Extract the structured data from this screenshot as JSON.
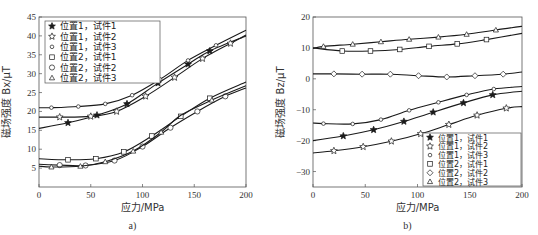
{
  "chart_data": [
    {
      "id": "a",
      "type": "line",
      "title": "",
      "subtitle": "a)",
      "xlabel": "应力/MPa",
      "ylabel": "磁场强度 Bx/μT",
      "xlim": [
        0,
        200
      ],
      "ylim": [
        0,
        45
      ],
      "xticks": [
        0,
        50,
        100,
        150,
        200
      ],
      "yticks": [
        5,
        10,
        15,
        20,
        25,
        30,
        35,
        40,
        45
      ],
      "grid": false,
      "legend_position": "upper left",
      "series": [
        {
          "name": "位置1，试件1",
          "marker": "star-filled",
          "x": [
            0,
            28,
            56,
            85,
            115,
            144,
            165,
            200
          ],
          "y": [
            15.5,
            17,
            19,
            22,
            27.5,
            32.5,
            36,
            40
          ],
          "marker_x": [
            28,
            56,
            85,
            115,
            144,
            165
          ]
        },
        {
          "name": "位置1，试件2",
          "marker": "star-open",
          "x": [
            0,
            20,
            50,
            75,
            103,
            131,
            158,
            185,
            200
          ],
          "y": [
            18.5,
            18.5,
            18.7,
            20,
            24,
            29,
            34,
            38,
            40.2
          ],
          "marker_x": [
            20,
            50,
            75,
            103,
            131,
            158,
            185
          ]
        },
        {
          "name": "位置1，试件3",
          "marker": "circle-small",
          "x": [
            0,
            12,
            38,
            64,
            90,
            117,
            144,
            171,
            200
          ],
          "y": [
            21,
            21,
            21.3,
            22,
            24.3,
            28.5,
            33.5,
            37.5,
            41.5
          ],
          "marker_x": [
            12,
            38,
            64,
            90,
            117,
            144,
            171
          ]
        },
        {
          "name": "位置2，试件1",
          "marker": "square",
          "x": [
            0,
            28,
            55,
            82,
            109,
            137,
            165,
            200
          ],
          "y": [
            7.5,
            7.2,
            7.5,
            9.3,
            13.5,
            18.7,
            23.5,
            27.8
          ],
          "marker_x": [
            28,
            55,
            82,
            109,
            137,
            165
          ]
        },
        {
          "name": "位置2，试件2",
          "marker": "circle",
          "x": [
            0,
            20,
            45,
            73,
            100,
            127,
            153,
            180,
            200
          ],
          "y": [
            6,
            5.8,
            5.7,
            7,
            10.7,
            15.7,
            20,
            24,
            26.2
          ],
          "marker_x": [
            20,
            45,
            73,
            100,
            127,
            153,
            180
          ]
        },
        {
          "name": "位置2，试件3",
          "marker": "triangle",
          "x": [
            0,
            12,
            40,
            64,
            91,
            118,
            137,
            167,
            200
          ],
          "y": [
            5.5,
            5.3,
            5.5,
            6.7,
            9.5,
            14.5,
            19,
            23,
            26.8
          ],
          "marker_x": [
            12,
            40,
            64,
            91,
            118,
            167
          ]
        }
      ]
    },
    {
      "id": "b",
      "type": "line",
      "title": "",
      "subtitle": "b)",
      "xlabel": "应力/MPa",
      "ylabel": "磁场强度 Bz/μT",
      "xlim": [
        0,
        200
      ],
      "ylim": [
        -35,
        20
      ],
      "xticks": [
        0,
        50,
        100,
        150,
        200
      ],
      "yticks": [
        -30,
        -20,
        -10,
        0,
        10,
        20
      ],
      "grid": false,
      "legend_position": "lower right",
      "series": [
        {
          "name": "位置1，试件1",
          "marker": "star-filled",
          "x": [
            0,
            29,
            58,
            87,
            115,
            144,
            172,
            200
          ],
          "y": [
            -20,
            -18.5,
            -16.5,
            -13.8,
            -10.8,
            -7.8,
            -5.2,
            -4
          ],
          "marker_x": [
            29,
            58,
            87,
            115,
            144,
            172
          ]
        },
        {
          "name": "位置1，试件2",
          "marker": "star-open",
          "x": [
            0,
            20,
            48,
            75,
            103,
            130,
            157,
            185,
            200
          ],
          "y": [
            -24,
            -23.3,
            -22,
            -20.2,
            -17.8,
            -14.8,
            -11.8,
            -9.5,
            -9
          ],
          "marker_x": [
            20,
            48,
            75,
            103,
            130,
            157,
            185
          ]
        },
        {
          "name": "位置1，试件3",
          "marker": "circle-small",
          "x": [
            0,
            10,
            38,
            65,
            92,
            120,
            147,
            173,
            200
          ],
          "y": [
            -14.3,
            -14.5,
            -14.6,
            -13.2,
            -10.2,
            -7.6,
            -5.2,
            -3.3,
            -2.5
          ],
          "marker_x": [
            10,
            38,
            65,
            92,
            120,
            147,
            173
          ]
        },
        {
          "name": "位置2，试件1",
          "marker": "square",
          "x": [
            0,
            28,
            55,
            83,
            111,
            138,
            166,
            200
          ],
          "y": [
            10,
            9,
            9,
            9.5,
            10.5,
            11.3,
            12.7,
            14.7
          ],
          "marker_x": [
            28,
            55,
            83,
            111,
            138,
            166
          ]
        },
        {
          "name": "位置2，试件2",
          "marker": "diamond",
          "x": [
            0,
            20,
            47,
            74,
            101,
            128,
            155,
            182,
            200
          ],
          "y": [
            1.6,
            1.6,
            1.5,
            1.5,
            1,
            0.6,
            1,
            1.5,
            2.2
          ],
          "marker_x": [
            20,
            47,
            74,
            101,
            128,
            155,
            182
          ]
        },
        {
          "name": "位置2，试件3",
          "marker": "triangle",
          "x": [
            0,
            10,
            38,
            65,
            92,
            120,
            147,
            175,
            200
          ],
          "y": [
            9.8,
            10.5,
            11.2,
            12,
            12.8,
            13.5,
            14.4,
            15.8,
            17
          ],
          "marker_x": [
            10,
            38,
            65,
            92,
            120,
            147,
            175
          ]
        }
      ]
    }
  ],
  "layout": {
    "panels": [
      {
        "plot": {
          "left": 39,
          "top": 17,
          "right": 246,
          "bottom": 187
        },
        "legend": {
          "x": 45,
          "y": 21,
          "w": 115,
          "h": 62
        },
        "ylabel_x": 10,
        "sub_y": 229
      },
      {
        "plot": {
          "left": 313,
          "top": 17,
          "right": 522,
          "bottom": 187
        },
        "legend": {
          "x": 423,
          "y": 133,
          "w": 98,
          "h": 53
        },
        "ylabel_x": 284,
        "sub_y": 229
      }
    ],
    "line_color": "#1a1a1a",
    "axis_color": "#555555"
  }
}
